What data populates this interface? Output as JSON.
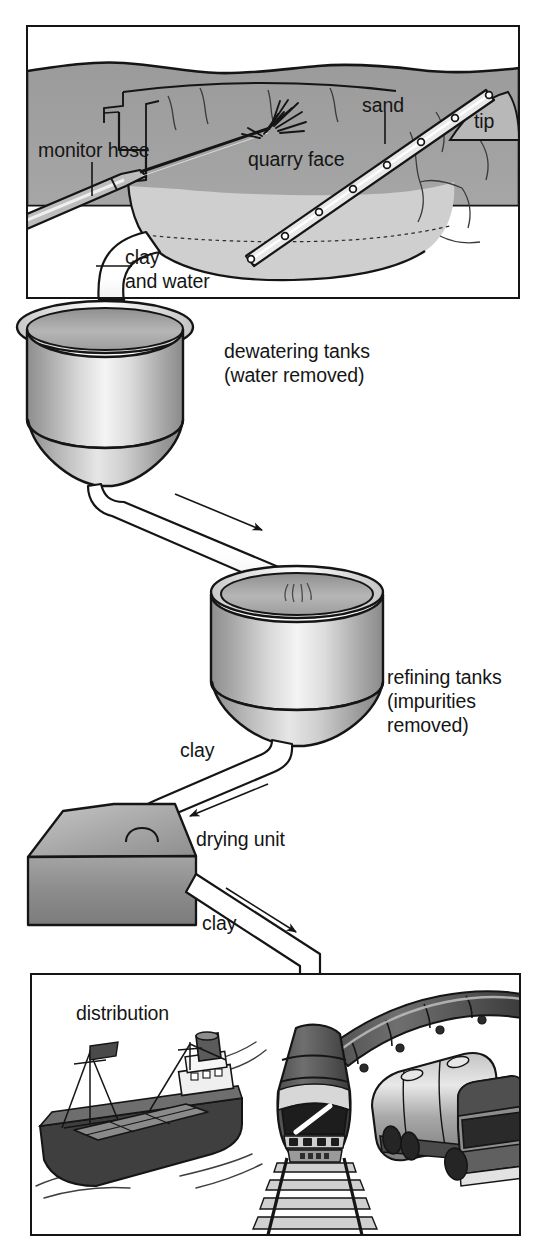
{
  "figure": {
    "width": 547,
    "height": 1255
  },
  "panels": {
    "quarry": {
      "name": "quarry cross-section",
      "labels": {
        "monitor_hose": "monitor hose",
        "quarry_face": "quarry face",
        "sand": "sand",
        "tip": "tip",
        "clay_and_water_line1": "clay",
        "clay_and_water_line2": "and water"
      }
    },
    "dewatering": {
      "label_line1": "dewatering tanks",
      "label_line2": "(water removed)"
    },
    "refining": {
      "label_line1": "refining tanks",
      "label_line2": "(impurities",
      "label_line3": "removed)",
      "flow_label": "clay"
    },
    "drying": {
      "label": "drying unit",
      "flow_label": "clay"
    },
    "distribution": {
      "label": "distribution",
      "inflow_label": "clay",
      "vehicles": [
        "cargo ship",
        "locomotive train",
        "tanker truck"
      ]
    }
  },
  "colors": {
    "ink": "#151515",
    "ground_upper": "#9a9a9a",
    "ground_lower": "#b4b4b4",
    "quarry_floor": "#c6c6c6",
    "tank_mid": "#a8a8a8",
    "tank_light": "#f2f2f2",
    "box_top": "#b0b0b0",
    "box_front": "#8f8f8f",
    "hull_dark": "#3c3c3c",
    "deck_gray": "#8a8a8a",
    "loco_dark": "#4a4a4a",
    "truck_gray": "#999999",
    "pipe_white": "#ffffff"
  }
}
